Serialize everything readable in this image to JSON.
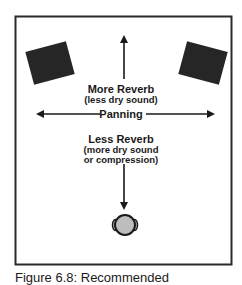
{
  "diagram": {
    "labels": {
      "more_reverb": "More Reverb",
      "more_reverb_sub": "(less dry sound)",
      "panning": "Panning",
      "less_reverb": "Less Reverb",
      "less_reverb_sub_1": "(more dry sound",
      "less_reverb_sub_2": "or compression)"
    },
    "elements": {
      "left_speaker": "speaker",
      "right_speaker": "speaker",
      "listener": "listener-head"
    },
    "colors": {
      "frame": "#2a2a2a",
      "speaker": "#262626",
      "arrow": "#1a1a1a",
      "head_fill": "#bdbdbd",
      "head_outline": "#1a1a1a"
    }
  },
  "caption": "Figure 6.8: Recommended"
}
